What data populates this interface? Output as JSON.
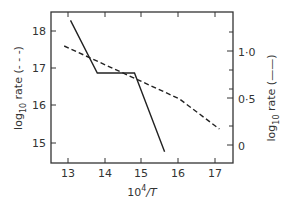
{
  "chart_data": {
    "type": "line",
    "title": "",
    "xlabel": "10^4/T",
    "xlabel_parts": {
      "base": "10",
      "sup": "4",
      "rest": "/T"
    },
    "ylabel_left": "log10 rate (- - -)",
    "ylabel_left_parts": {
      "pre": "log",
      "sub": "10",
      "post": " rate (- - -)"
    },
    "ylabel_right": "log10 rate (——)",
    "ylabel_right_parts": {
      "pre": "log",
      "sub": "10",
      "post": " rate (——)"
    },
    "x_ticks": [
      "13",
      "14",
      "15",
      "16",
      "17"
    ],
    "y_left_ticks": [
      "15",
      "16",
      "17",
      "18"
    ],
    "y_right_ticks": [
      "0",
      "0·5",
      "1·0"
    ],
    "xlim": [
      12.5,
      17.45
    ],
    "ylim_left": [
      14.5,
      18.5
    ],
    "ylim_right": [
      -0.19,
      1.42
    ],
    "grid": false,
    "legend": "none (line styles indicated in axis labels)",
    "series": [
      {
        "name": "log10 rate (dashed, left axis)",
        "axis": "left",
        "style": "dashed",
        "x": [
          12.86,
          15.99,
          17.08
        ],
        "y": [
          17.6,
          16.2,
          15.4
        ]
      },
      {
        "name": "log10 rate (solid, right axis)",
        "axis": "right",
        "style": "solid",
        "x": [
          13.03,
          13.76,
          14.77,
          15.59
        ],
        "y": [
          1.33,
          0.77,
          0.77,
          -0.07
        ]
      }
    ]
  }
}
